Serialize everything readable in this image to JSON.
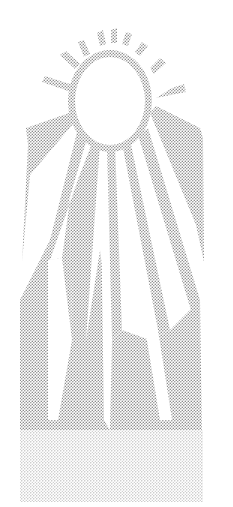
{
  "illustration": {
    "subject": "sun-with-rays",
    "style": "stippled halftone",
    "colors": {
      "background": "#ffffff",
      "dot": "#8a8a8a",
      "sun_disc": "#ffffff"
    }
  }
}
